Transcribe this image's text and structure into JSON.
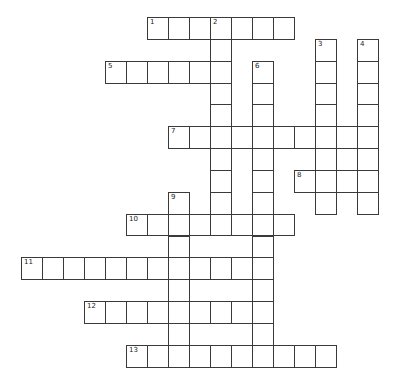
{
  "puzzle": {
    "type": "crossword",
    "grid_origin": {
      "x": 21,
      "y": 17
    },
    "cell_width": 21,
    "cell_height": 21.85,
    "line_color": "#3a3a3a",
    "entries": [
      {
        "number": "1",
        "direction": "across",
        "row": 0,
        "col": 6,
        "length": 7
      },
      {
        "number": "2",
        "direction": "down",
        "row": 0,
        "col": 9,
        "length": 10
      },
      {
        "number": "3",
        "direction": "down",
        "row": 1,
        "col": 14,
        "length": 8
      },
      {
        "number": "4",
        "direction": "down",
        "row": 1,
        "col": 16,
        "length": 8
      },
      {
        "number": "5",
        "direction": "across",
        "row": 2,
        "col": 4,
        "length": 6
      },
      {
        "number": "6",
        "direction": "down",
        "row": 2,
        "col": 11,
        "length": 14
      },
      {
        "number": "7",
        "direction": "across",
        "row": 5,
        "col": 7,
        "length": 10
      },
      {
        "number": "8",
        "direction": "across",
        "row": 7,
        "col": 13,
        "length": 4
      },
      {
        "number": "9",
        "direction": "down",
        "row": 8,
        "col": 7,
        "length": 8
      },
      {
        "number": "10",
        "direction": "across",
        "row": 9,
        "col": 5,
        "length": 8
      },
      {
        "number": "11",
        "direction": "across",
        "row": 11,
        "col": 0,
        "length": 12
      },
      {
        "number": "12",
        "direction": "across",
        "row": 13,
        "col": 3,
        "length": 9
      },
      {
        "number": "13",
        "direction": "across",
        "row": 15,
        "col": 5,
        "length": 10
      }
    ]
  }
}
